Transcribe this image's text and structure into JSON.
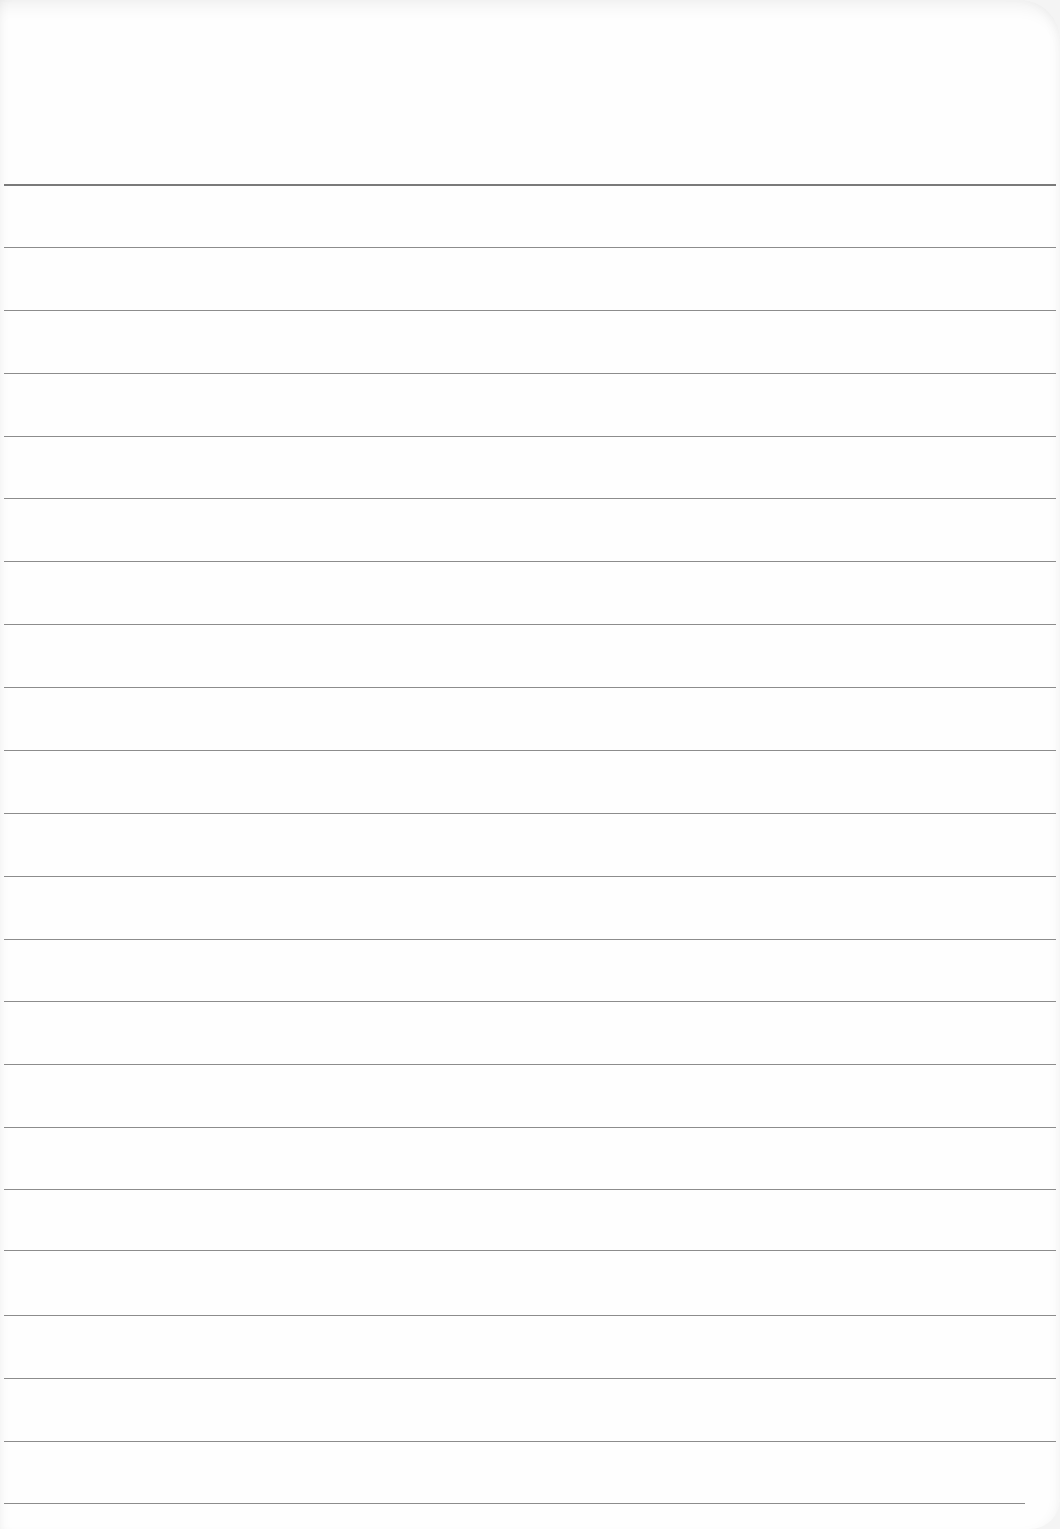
{
  "page": {
    "type": "blank lined paper",
    "line_color": "#8c8c8c",
    "background": "#fefefe",
    "lines": [
      184,
      247,
      310,
      373,
      436,
      498,
      561,
      624,
      687,
      750,
      813,
      876,
      939,
      1001,
      1064,
      1127,
      1189,
      1250,
      1315,
      1378,
      1441,
      1503
    ]
  }
}
